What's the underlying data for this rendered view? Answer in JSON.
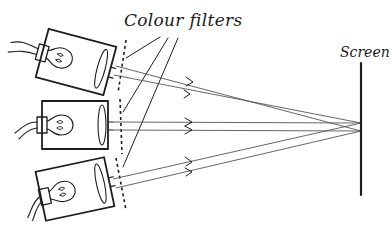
{
  "diagram": {
    "labels": {
      "filters": "Colour filters",
      "screen": "Screen"
    },
    "components": {
      "lamps": [
        {
          "id": "top",
          "name": "top-lamp",
          "rotation_deg": 15
        },
        {
          "id": "middle",
          "name": "middle-lamp",
          "rotation_deg": 0
        },
        {
          "id": "bottom",
          "name": "bottom-lamp",
          "rotation_deg": -12
        }
      ],
      "filter_count": 3,
      "screen": {
        "x": 361,
        "y_top": 63,
        "y_bottom": 195
      }
    },
    "colors": {
      "ink": "#1e1e1e",
      "beam": "#555555",
      "background": "#ffffff"
    }
  }
}
